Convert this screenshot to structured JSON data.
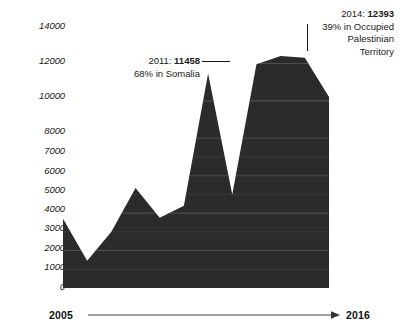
{
  "chart_data": {
    "type": "area",
    "title": "",
    "subtitle": "",
    "xlabel": "",
    "ylabel": "",
    "grid": true,
    "legend_position": "none",
    "xlim": [
      2005,
      2016
    ],
    "ylim": [
      0,
      14000
    ],
    "x": [
      2005,
      2006,
      2007,
      2008,
      2009,
      2010,
      2011,
      2012,
      2013,
      2014,
      2015,
      2016
    ],
    "categories": [
      "2005",
      "2006",
      "2007",
      "2008",
      "2009",
      "2010",
      "2011",
      "2012",
      "2013",
      "2014",
      "2015",
      "2016"
    ],
    "values": [
      3700,
      1450,
      3000,
      5350,
      3750,
      4400,
      11458,
      5000,
      11950,
      12393,
      12300,
      10200
    ],
    "series": [
      {
        "name": "",
        "values": [
          3700,
          1450,
          3000,
          5350,
          3750,
          4400,
          11458,
          5000,
          11950,
          12393,
          12300,
          10200
        ]
      }
    ],
    "y_ticks": [
      14000,
      12000,
      10000,
      8000,
      7000,
      6000,
      5000,
      4000,
      3000,
      2000,
      1000,
      0
    ],
    "y_tick_labels": [
      "14000",
      "12000",
      "10000",
      "8000",
      "7000",
      "6000",
      "5000",
      "4000",
      "3000",
      "2000",
      "1000",
      "0"
    ],
    "x_tick_labels": [
      "2005",
      "2016"
    ],
    "area_color": "#2b2b2b",
    "gridline_color": "#55545a",
    "text_color": "#1a1a1a",
    "annotations": [
      {
        "id": "2011",
        "head_prefix": "2011: ",
        "head_value": "11458",
        "sub": "68% in Somalia",
        "leader": "horizontal"
      },
      {
        "id": "2014",
        "head_prefix": "2014: ",
        "head_value": "12393",
        "sub_line_1": "39% in Occupied",
        "sub_line_2": "Palestinian",
        "sub_line_3": "Territory",
        "leader": "vertical"
      }
    ]
  },
  "y_axis": {
    "ticks": [
      {
        "label": "14000",
        "top": 21
      },
      {
        "label": "12000",
        "top": 56
      },
      {
        "label": "10000",
        "top": 91
      },
      {
        "label": "8000",
        "top": 126
      },
      {
        "label": "7000",
        "top": 146
      },
      {
        "label": "6000",
        "top": 166
      },
      {
        "label": "5000",
        "top": 185
      },
      {
        "label": "4000",
        "top": 204
      },
      {
        "label": "3000",
        "top": 223
      },
      {
        "label": "2000",
        "top": 243
      },
      {
        "label": "1000",
        "top": 262
      },
      {
        "label": "0",
        "top": 282
      }
    ]
  },
  "annotation_2011": {
    "head_prefix": "2011: ",
    "head_value": "11458",
    "sub": "68% in Somalia"
  },
  "annotation_2014": {
    "head_prefix": "2014: ",
    "head_value": "12393",
    "sub_1": "39% in Occupied",
    "sub_2": "Palestinian",
    "sub_3": "Territory"
  },
  "x_axis": {
    "start_label": "2005",
    "end_label": "2016",
    "arrow_icon": "arrow-right-icon"
  }
}
